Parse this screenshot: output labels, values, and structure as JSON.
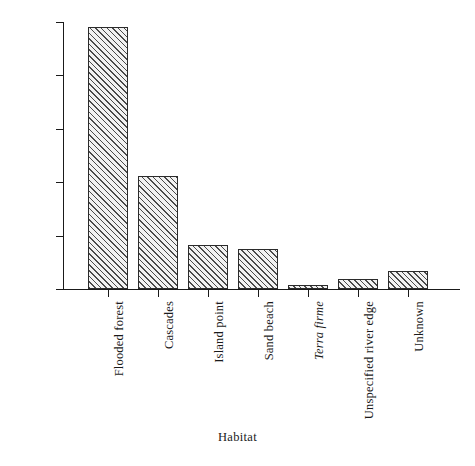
{
  "chart_data": {
    "type": "bar",
    "title": "",
    "xlabel": "Habitat",
    "ylabel": "",
    "ylim": [
      0,
      2500
    ],
    "ytick_values": [
      0,
      500,
      1000,
      1500,
      2000,
      2500
    ],
    "ytick_labels": [
      "0",
      "500",
      "1000",
      "1500",
      "2000",
      "2500"
    ],
    "grid": false,
    "legend": null,
    "categories": [
      "Flooded forest",
      "Cascades",
      "Island point",
      "Sand beach",
      "Terra firme",
      "Unspecified river edge",
      "Unknown"
    ],
    "categories_italic": [
      false,
      false,
      false,
      false,
      true,
      false,
      false
    ],
    "values": [
      2450,
      1060,
      415,
      370,
      35,
      90,
      165
    ],
    "bar_style": {
      "fill": "#f2f2f2",
      "hatch": "diagonal-45",
      "hatch_color": "#4a4a4a",
      "edge_color": "#2b2b2b"
    }
  },
  "axis": {
    "x_title": "Habitat"
  }
}
